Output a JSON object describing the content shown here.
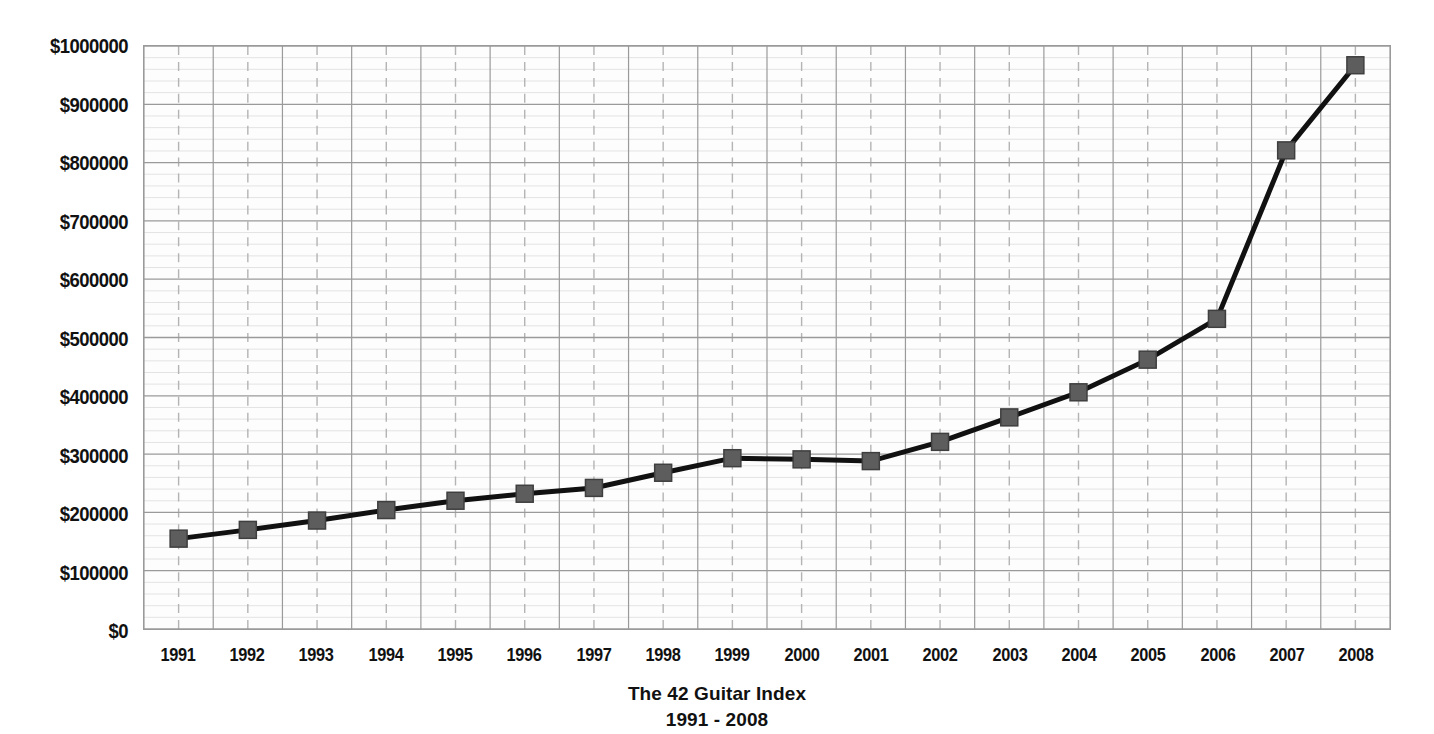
{
  "chart_data": {
    "type": "line",
    "title": "The 42 Guitar Index",
    "subtitle": "1991 - 2008",
    "xlabel": "",
    "ylabel": "",
    "categories": [
      "1991",
      "1992",
      "1993",
      "1994",
      "1995",
      "1996",
      "1997",
      "1998",
      "1999",
      "2000",
      "2001",
      "2002",
      "2003",
      "2004",
      "2005",
      "2006",
      "2007",
      "2008"
    ],
    "values": [
      155000,
      170000,
      186000,
      204000,
      220000,
      232000,
      242000,
      268000,
      293000,
      291000,
      288000,
      321000,
      363000,
      406000,
      462000,
      532000,
      821000,
      967000
    ],
    "series": [
      {
        "name": "The 42 Guitar Index",
        "values": [
          155000,
          170000,
          186000,
          204000,
          220000,
          232000,
          242000,
          268000,
          293000,
          291000,
          288000,
          321000,
          363000,
          406000,
          462000,
          532000,
          821000,
          967000
        ]
      }
    ],
    "ylim": [
      0,
      1000000
    ],
    "ytick_values": [
      0,
      100000,
      200000,
      300000,
      400000,
      500000,
      600000,
      700000,
      800000,
      900000,
      1000000
    ],
    "ytick_labels": [
      "$0",
      "$100000",
      "$200000",
      "$300000",
      "$400000",
      "$500000",
      "$600000",
      "$700000",
      "$800000",
      "$900000",
      "$1000000"
    ],
    "xtick_labels": [
      "1991",
      "1992",
      "1993",
      "1994",
      "1995",
      "1996",
      "1997",
      "1998",
      "1999",
      "2000",
      "2001",
      "2002",
      "2003",
      "2004",
      "2005",
      "2006",
      "2007",
      "2008"
    ],
    "grid": {
      "major_horizontal": true,
      "minor_horizontal": true,
      "minor_horizontal_per_major": 5,
      "major_vertical": true,
      "vertical_dashed_at_ticks": true,
      "legend": "none"
    },
    "style": {
      "line_color": "#111111",
      "line_width": 5,
      "marker": "square",
      "marker_size": 17,
      "marker_fill": "#5d5d5d",
      "marker_edge": "#3f3f3f",
      "major_grid_color": "#9a9a9a",
      "minor_grid_color": "#e3e3e3",
      "dashed_grid_color": "#b4b4b4",
      "plot_background": "#fdfdfd",
      "text_color": "#111111"
    }
  }
}
